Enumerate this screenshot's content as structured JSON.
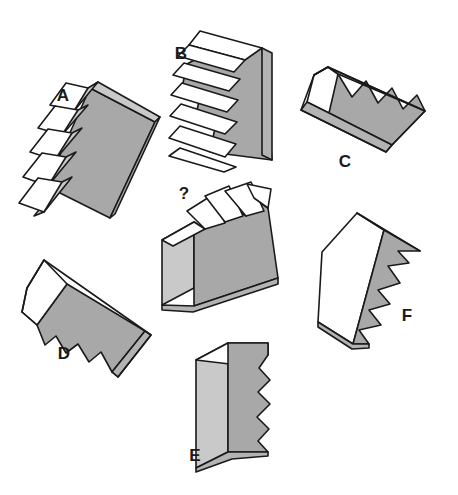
{
  "puzzle": {
    "type": "spatial-reasoning-3d-shape-matching",
    "background_color": "#ffffff",
    "canvas": {
      "width": 458,
      "height": 495
    },
    "colors": {
      "outline": "#1a1a1a",
      "white_face": "#ffffff",
      "light_gray_face": "#c9c9c9",
      "mid_gray_face": "#b3b3b3",
      "dark_gray_face": "#a8a8a8"
    },
    "labels": [
      {
        "id": "A",
        "text": "A",
        "x": 63,
        "y": 97
      },
      {
        "id": "B",
        "text": "B",
        "x": 181,
        "y": 55
      },
      {
        "id": "C",
        "text": "C",
        "x": 345,
        "y": 163
      },
      {
        "id": "D",
        "text": "D",
        "x": 64,
        "y": 355
      },
      {
        "id": "E",
        "text": "E",
        "x": 195,
        "y": 457
      },
      {
        "id": "F",
        "text": "F",
        "x": 407,
        "y": 317
      },
      {
        "id": "Q",
        "text": "?",
        "x": 184,
        "y": 195
      }
    ],
    "shapes": [
      {
        "id": "Q",
        "name": "reference-shape",
        "label": "?",
        "description": "Rectangular block seen in isometric view with four white sawtooth peaks rising from the top edge",
        "teeth_count": 4,
        "orientation_deg": 0
      },
      {
        "id": "A",
        "name": "option-shape-a",
        "label": "A",
        "description": "Block rotated so the sawtooth teeth project toward the upper-left, white tooth faces visible",
        "teeth_count": 5,
        "orientation_deg": -55
      },
      {
        "id": "B",
        "name": "option-shape-b",
        "label": "B",
        "description": "Upright block with sawtooth teeth projecting from the left side, white tooth faces",
        "teeth_count": 5,
        "orientation_deg": 0
      },
      {
        "id": "C",
        "name": "option-shape-c",
        "label": "C",
        "description": "Tilted slab with triangular notches cut into the gray upper-right long face",
        "teeth_count": 4,
        "orientation_deg": 28
      },
      {
        "id": "D",
        "name": "option-shape-d",
        "label": "D",
        "description": "Tilted slab with triangular notches cut along the lower long edge",
        "teeth_count": 4,
        "orientation_deg": 32
      },
      {
        "id": "E",
        "name": "option-shape-e",
        "label": "E",
        "description": "Upright block with sawtooth notches cut into the right-hand gray face",
        "teeth_count": 5,
        "orientation_deg": 0
      },
      {
        "id": "F",
        "name": "option-shape-f",
        "label": "F",
        "description": "Block tilted clockwise with sawtooth notches along the right gray face",
        "teeth_count": 5,
        "orientation_deg": 15
      }
    ]
  }
}
